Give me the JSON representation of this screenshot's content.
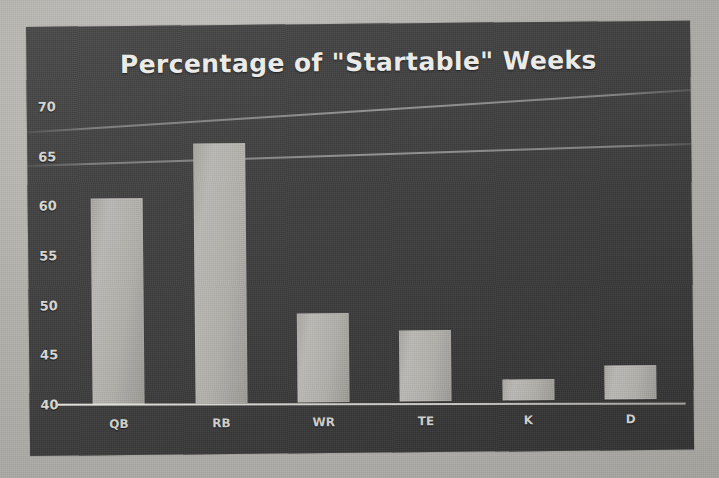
{
  "chart_data": {
    "type": "bar",
    "title": "Percentage of \"Startable\" Weeks",
    "xlabel": "",
    "ylabel": "",
    "categories": [
      "QB",
      "RB",
      "WR",
      "TE",
      "K",
      "D"
    ],
    "values": [
      60.7,
      66.2,
      49.0,
      47.1,
      42.1,
      43.4
    ],
    "ylim": [
      40,
      72
    ],
    "yticks": [
      70,
      65,
      60,
      55,
      50,
      45,
      40
    ],
    "ytick_labels": [
      "70",
      "65",
      "60",
      "55",
      "50",
      "45",
      "40"
    ],
    "grid": false,
    "legend": null,
    "series": [
      {
        "name": "Percentage of Startable Weeks",
        "values": [
          60.7,
          66.2,
          49.0,
          47.1,
          42.1,
          43.4
        ]
      }
    ],
    "colors": {
      "bar_fill": "#b2b0ab",
      "panel_background": "#3f3f3f",
      "title_color": "#eceae6",
      "axis_label_color": "#d7d5d0",
      "axis_line_color": "#ebe9e4",
      "photo_background": "#b4b2ad"
    }
  }
}
